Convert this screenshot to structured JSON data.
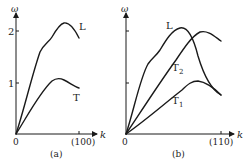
{
  "panels": [
    {
      "id": "a",
      "caption": "(a)",
      "y_axis_label": "ω",
      "x_axis_label": "k",
      "origin_label": "0",
      "y_ticks": [
        "1",
        "2"
      ],
      "x_tick_label": "(100)",
      "curves": [
        {
          "name": "L",
          "label": "L"
        },
        {
          "name": "T",
          "label": "T"
        }
      ]
    },
    {
      "id": "b",
      "caption": "(b)",
      "y_axis_label": "ω",
      "x_axis_label": "k",
      "origin_label": "0",
      "x_tick_label": "(110)",
      "curves": [
        {
          "name": "L",
          "label": "L"
        },
        {
          "name": "T2",
          "label": "T",
          "subscript": "2"
        },
        {
          "name": "T1",
          "label": "T",
          "subscript": "1"
        }
      ]
    }
  ]
}
